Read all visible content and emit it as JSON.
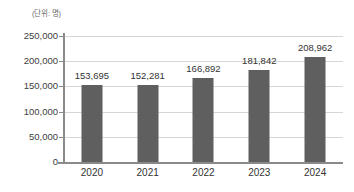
{
  "chart_data": {
    "type": "bar",
    "title": "",
    "subtitle": "",
    "unit_label": "(단위: 명)",
    "xlabel": "",
    "ylabel": "",
    "categories": [
      "2020",
      "2021",
      "2022",
      "2023",
      "2024"
    ],
    "values": [
      153695,
      152281,
      166892,
      181842,
      208962
    ],
    "value_labels": [
      "153,695",
      "152,281",
      "166,892",
      "181,842",
      "208,962"
    ],
    "series": [
      {
        "name": "",
        "values": [
          153695,
          152281,
          166892,
          181842,
          208962
        ]
      }
    ],
    "ylim": [
      0,
      250000
    ],
    "ytick_values": [
      0,
      50000,
      100000,
      150000,
      200000,
      250000
    ],
    "ytick_labels": [
      "0",
      "50,000",
      "100,000",
      "150,000",
      "200,000",
      "250,000"
    ],
    "grid": true,
    "grid_axis": "y",
    "legend": false,
    "legend_position": "none",
    "bar_color": "#5f5f5f",
    "gridline_color": "#d6d6d6",
    "axis_color": "#8a8a8a",
    "text_color": "#333333",
    "background_color": "#ffffff"
  }
}
